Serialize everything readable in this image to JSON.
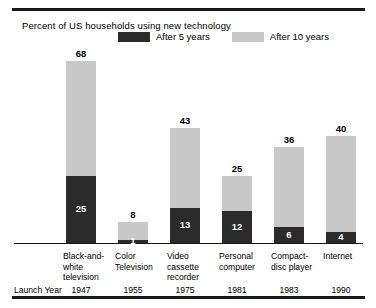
{
  "chart_data": {
    "type": "bar",
    "title": "Percent of US households using new technology",
    "xlabel": "",
    "ylabel": "",
    "ylim": [
      0,
      68
    ],
    "grid": false,
    "legend_position": "top",
    "stacked": true,
    "categories": [
      "Black-and-white television",
      "Color Television",
      "Video cassette recorder",
      "Personal computer",
      "Compact-disc player",
      "Internet"
    ],
    "series": [
      {
        "name": "After 5 years",
        "values": [
          25,
          1,
          13,
          12,
          6,
          4
        ],
        "color": "#2b2b2b"
      },
      {
        "name": "After 10 years",
        "values": [
          68,
          8,
          43,
          25,
          36,
          40
        ],
        "color": "#c8c8c8"
      }
    ],
    "launch_years": [
      1947,
      1955,
      1975,
      1981,
      1983,
      1990
    ],
    "launch_year_label": "Launch Year"
  },
  "bars": [
    {
      "category_lines": [
        "Black-and-",
        "white",
        "television"
      ],
      "after5": 25,
      "after10": 68,
      "launch_year": 1947
    },
    {
      "category_lines": [
        "Color",
        "Television"
      ],
      "after5": 1,
      "after10": 8,
      "launch_year": 1955
    },
    {
      "category_lines": [
        "Video",
        "cassette",
        "recorder"
      ],
      "after5": 13,
      "after10": 43,
      "launch_year": 1975
    },
    {
      "category_lines": [
        "Personal",
        "computer"
      ],
      "after5": 12,
      "after10": 25,
      "launch_year": 1981
    },
    {
      "category_lines": [
        "Compact-",
        "disc player"
      ],
      "after5": 6,
      "after10": 36,
      "launch_year": 1983
    },
    {
      "category_lines": [
        "Internet"
      ],
      "after5": 4,
      "after10": 40,
      "launch_year": 1990
    }
  ],
  "legend": {
    "items": [
      {
        "label": "After 5 years",
        "color": "#2b2b2b"
      },
      {
        "label": "After 10 years",
        "color": "#c8c8c8"
      }
    ]
  },
  "colors": {
    "after5": "#2b2b2b",
    "after10": "#c8c8c8",
    "rule": "#1a1a1a",
    "text": "#000000",
    "value_inner_text": "#ffffff"
  }
}
